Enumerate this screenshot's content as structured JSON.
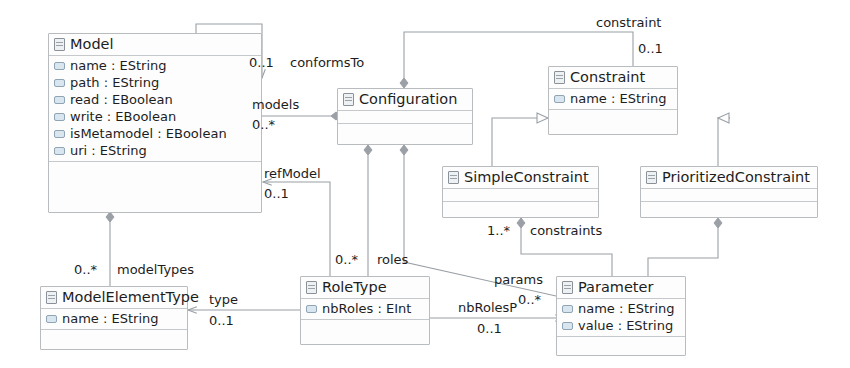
{
  "diagram": {
    "stroke_color": "#9aa0a6",
    "class_fill": "#fdfdfd",
    "class_border": "#b9bcbe"
  },
  "classes": [
    {
      "id": "model",
      "name": "Model",
      "icon": "class-icon",
      "attributes": [
        "name : EString",
        "path : EString",
        "read : EBoolean",
        "write : EBoolean",
        "isMetamodel : EBoolean",
        "uri : EString"
      ]
    },
    {
      "id": "configuration",
      "name": "Configuration",
      "icon": "class-icon",
      "attributes": []
    },
    {
      "id": "constraint",
      "name": "Constraint",
      "icon": "class-icon",
      "attributes": [
        "name : EString"
      ]
    },
    {
      "id": "simpleconstraint",
      "name": "SimpleConstraint",
      "icon": "class-icon",
      "attributes": []
    },
    {
      "id": "prioritizedconstraint",
      "name": "PrioritizedConstraint",
      "icon": "class-icon",
      "attributes": []
    },
    {
      "id": "modelelementtype",
      "name": "ModelElementType",
      "icon": "class-icon",
      "attributes": [
        "name : EString"
      ]
    },
    {
      "id": "roletype",
      "name": "RoleType",
      "icon": "class-icon",
      "attributes": [
        "nbRoles : EInt"
      ]
    },
    {
      "id": "parameter",
      "name": "Parameter",
      "icon": "class-icon",
      "attributes": [
        "name : EString",
        "value : EString"
      ]
    }
  ],
  "associations": [
    {
      "id": "conformsto",
      "label": "conformsTo",
      "multiplicity": "0..1",
      "from": "model",
      "to": "model",
      "kind": "self-reference"
    },
    {
      "id": "models",
      "label": "models",
      "multiplicity": "0..*",
      "from": "configuration",
      "to": "model",
      "kind": "aggregation"
    },
    {
      "id": "refmodel",
      "label": "refModel",
      "multiplicity": "0..1",
      "from": "roletype",
      "to": "model",
      "kind": "association"
    },
    {
      "id": "constraint_assoc",
      "label": "constraint",
      "multiplicity": "0..1",
      "from": "configuration",
      "to": "constraint",
      "kind": "aggregation"
    },
    {
      "id": "modeltypes",
      "label": "modelTypes",
      "multiplicity": "0..*",
      "from": "model",
      "to": "modelelementtype",
      "kind": "aggregation"
    },
    {
      "id": "roles",
      "label": "roles",
      "multiplicity": "0..*",
      "from": "configuration",
      "to": "roletype",
      "kind": "aggregation"
    },
    {
      "id": "params",
      "label": "params",
      "multiplicity": "0..*",
      "from": "configuration",
      "to": "parameter",
      "kind": "aggregation"
    },
    {
      "id": "constraints",
      "label": "constraints",
      "multiplicity": "1..*",
      "from": "simpleconstraint",
      "to": "parameter",
      "kind": "aggregation"
    },
    {
      "id": "type",
      "label": "type",
      "multiplicity": "0..1",
      "from": "roletype",
      "to": "modelelementtype",
      "kind": "association"
    },
    {
      "id": "nbrolesp",
      "label": "nbRolesP",
      "multiplicity": "0..1",
      "from": "roletype",
      "to": "parameter",
      "kind": "association"
    }
  ],
  "generalizations": [
    {
      "id": "gen-simple",
      "from": "simpleconstraint",
      "to": "constraint"
    },
    {
      "id": "gen-prioritized",
      "from": "prioritizedconstraint",
      "to": "constraint"
    }
  ],
  "labels": {
    "conformsTo": "conformsTo",
    "conformsTo_mult": "0..1",
    "models": "models",
    "models_mult": "0..*",
    "refModel": "refModel",
    "refModel_mult": "0..1",
    "constraint": "constraint",
    "constraint_mult": "0..1",
    "modelTypes": "modelTypes",
    "modelTypes_mult": "0..*",
    "roles": "roles",
    "roles_mult": "0..*",
    "params": "params",
    "params_mult": "0..*",
    "constraints": "constraints",
    "constraints_mult": "1..*",
    "type": "type",
    "type_mult": "0..1",
    "nbRolesP": "nbRolesP",
    "nbRolesP_mult": "0..1"
  }
}
